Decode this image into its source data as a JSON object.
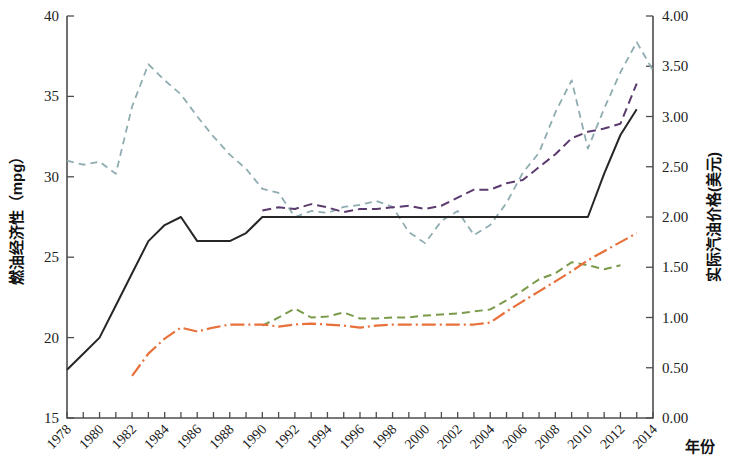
{
  "chart_data": {
    "type": "line",
    "title": "",
    "xlabel": "年份",
    "ylabel": "燃油经济性（mpg）",
    "y2label": "实际汽油价格(美元)",
    "xlim": [
      1978,
      2014
    ],
    "ylim": [
      15,
      40
    ],
    "y2lim": [
      0.0,
      4.0
    ],
    "grid": false,
    "legend_position": "none",
    "x_tick_labels": [
      "1978",
      "1980",
      "1982",
      "1984",
      "1986",
      "1988",
      "1990",
      "1992",
      "1994",
      "1996",
      "1998",
      "2000",
      "2002",
      "2004",
      "2006",
      "2008",
      "2010",
      "2012",
      "2014"
    ],
    "x_minor_ticks_every": 1,
    "y_tick_labels": [
      "15",
      "20",
      "25",
      "30",
      "35",
      "40"
    ],
    "y2_tick_labels": [
      "0.00",
      "0.50",
      "1.00",
      "1.50",
      "2.00",
      "2.50",
      "3.00",
      "3.50",
      "4.00"
    ],
    "series": [
      {
        "name": "实际汽油价格",
        "color": "#8fadb0",
        "dash": "7,5",
        "width": 1.8,
        "axis": "right",
        "x": [
          1978,
          1979,
          1980,
          1981,
          1982,
          1983,
          1984,
          1985,
          1986,
          1987,
          1988,
          1989,
          1990,
          1991,
          1992,
          1993,
          1994,
          1995,
          1996,
          1997,
          1998,
          1999,
          2000,
          2001,
          2002,
          2003,
          2004,
          2005,
          2006,
          2007,
          2008,
          2009,
          2010,
          2011,
          2012,
          2013,
          2014
        ],
        "values": [
          2.56,
          2.52,
          2.55,
          2.43,
          3.1,
          3.52,
          3.36,
          3.22,
          3.0,
          2.8,
          2.62,
          2.48,
          2.28,
          2.24,
          2.0,
          2.06,
          2.04,
          2.1,
          2.12,
          2.16,
          2.1,
          1.85,
          1.74,
          1.96,
          2.06,
          1.82,
          1.92,
          2.14,
          2.44,
          2.64,
          3.04,
          3.36,
          2.68,
          3.08,
          3.44,
          3.74,
          3.46
        ]
      },
      {
        "name": "乘用车燃油经济性标准",
        "color": "#262626",
        "dash": "none",
        "width": 2.0,
        "axis": "left",
        "x": [
          1978,
          1979,
          1980,
          1981,
          1982,
          1983,
          1984,
          1985,
          1986,
          1987,
          1988,
          1989,
          1990,
          1991,
          1992,
          1993,
          1994,
          1995,
          1996,
          1997,
          1998,
          1999,
          2000,
          2001,
          2002,
          2003,
          2004,
          2005,
          2006,
          2007,
          2008,
          2009,
          2010,
          2011,
          2012,
          2013
        ],
        "values": [
          18.0,
          19.0,
          20.0,
          22.0,
          24.0,
          26.0,
          27.0,
          27.5,
          26.0,
          26.0,
          26.0,
          26.5,
          27.5,
          27.5,
          27.5,
          27.5,
          27.5,
          27.5,
          27.5,
          27.5,
          27.5,
          27.5,
          27.5,
          27.5,
          27.5,
          27.5,
          27.5,
          27.5,
          27.5,
          27.5,
          27.5,
          27.5,
          27.5,
          30.2,
          32.6,
          34.2
        ]
      },
      {
        "name": "乘用车实际燃油经济性",
        "color": "#5b3a6e",
        "dash": "9,5",
        "width": 2.0,
        "axis": "left",
        "x": [
          1990,
          1991,
          1992,
          1993,
          1994,
          1995,
          1996,
          1997,
          1998,
          1999,
          2000,
          2001,
          2002,
          2003,
          2004,
          2005,
          2006,
          2007,
          2008,
          2009,
          2010,
          2011,
          2012,
          2013
        ],
        "values": [
          27.9,
          28.1,
          28.0,
          28.3,
          28.1,
          27.8,
          28.0,
          28.0,
          28.1,
          28.2,
          28.0,
          28.2,
          28.7,
          29.2,
          29.2,
          29.6,
          29.8,
          30.6,
          31.4,
          32.4,
          32.8,
          33.0,
          33.3,
          35.8
        ]
      },
      {
        "name": "轻型卡车实际燃油经济性",
        "color": "#7a9a4a",
        "dash": "8,5",
        "width": 2.0,
        "axis": "right",
        "x": [
          1990,
          1991,
          1992,
          1993,
          1994,
          1995,
          1996,
          1997,
          1998,
          1999,
          2000,
          2001,
          2002,
          2003,
          2004,
          2005,
          2006,
          2007,
          2008,
          2009,
          2010,
          2011,
          2012
        ],
        "values": [
          0.92,
          1.0,
          1.09,
          1.0,
          1.01,
          1.05,
          0.99,
          0.99,
          1.0,
          1.0,
          1.02,
          1.03,
          1.04,
          1.06,
          1.08,
          1.17,
          1.27,
          1.38,
          1.44,
          1.55,
          1.52,
          1.48,
          1.52
        ]
      },
      {
        "name": "轻型卡车燃油经济性标准",
        "color": "#e8703a",
        "dash": "14,4,2,4",
        "width": 2.2,
        "axis": "right",
        "x": [
          1982,
          1983,
          1984,
          1985,
          1986,
          1987,
          1988,
          1989,
          1990,
          1991,
          1992,
          1993,
          1994,
          1995,
          1996,
          1997,
          1998,
          1999,
          2000,
          2001,
          2002,
          2003,
          2004,
          2005,
          2006,
          2007,
          2008,
          2009,
          2010,
          2011,
          2012,
          2013
        ],
        "values": [
          0.42,
          0.64,
          0.79,
          0.9,
          0.86,
          0.9,
          0.93,
          0.93,
          0.93,
          0.91,
          0.93,
          0.94,
          0.93,
          0.92,
          0.9,
          0.92,
          0.93,
          0.93,
          0.93,
          0.93,
          0.93,
          0.93,
          0.95,
          1.06,
          1.16,
          1.26,
          1.36,
          1.46,
          1.57,
          1.66,
          1.75,
          1.84
        ]
      }
    ]
  },
  "axes": {
    "left_title": "燃油经济性（mpg）",
    "right_title": "实际汽油价格(美元)",
    "x_title": "年份"
  }
}
